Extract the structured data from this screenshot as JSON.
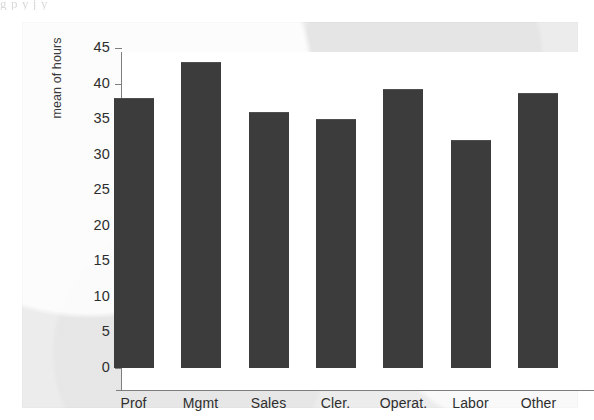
{
  "page": {
    "top_cut_text": "g p        y   j  y"
  },
  "chart_data": {
    "type": "bar",
    "title": "",
    "xlabel": "",
    "ylabel": "mean of hours",
    "categories": [
      "Prof",
      "Mgmt",
      "Sales",
      "Cler.",
      "Operat.",
      "Labor",
      "Other"
    ],
    "values": [
      38,
      43,
      36,
      35,
      39.3,
      32,
      38.7
    ],
    "ylim": [
      0,
      45
    ],
    "ytick_values": [
      0,
      5,
      10,
      15,
      20,
      25,
      30,
      35,
      40,
      45
    ],
    "ytick_labels": [
      "0",
      "5",
      "10",
      "15",
      "20",
      "25",
      "30",
      "35",
      "40",
      "45"
    ],
    "grid": false,
    "legend": null,
    "bar_color": "#3c3c3c",
    "axis_color": "#7e7e7e",
    "plot_background": "#ffffff",
    "figure_background": "#ececec"
  }
}
